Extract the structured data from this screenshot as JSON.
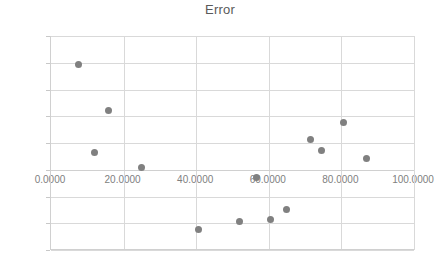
{
  "chart_data": {
    "type": "scatter",
    "title": "Error",
    "xlabel": "",
    "ylabel": "",
    "xlim": [
      0,
      100
    ],
    "ylim": [
      -0.6,
      1.0
    ],
    "grid": true,
    "legend": "none",
    "marker_color": "#808080",
    "x_ticks": [
      "0.0000",
      "20.0000",
      "40.0000",
      "60.0000",
      "80.0000",
      "100.0000"
    ],
    "x_tick_values": [
      0,
      20,
      40,
      60,
      80,
      100
    ],
    "y_ticks": [
      "1.0000",
      "0.8000",
      "0.6000",
      "0.4000",
      "0.2000",
      "0.0000",
      "-0.2000",
      "-0.4000",
      "-0.6000"
    ],
    "y_tick_values": [
      1.0,
      0.8,
      0.6,
      0.4,
      0.2,
      0.0,
      -0.2,
      -0.4,
      -0.6
    ],
    "points": [
      {
        "x": 7.5,
        "y": 0.79
      },
      {
        "x": 12.0,
        "y": 0.13
      },
      {
        "x": 15.8,
        "y": 0.44
      },
      {
        "x": 24.8,
        "y": 0.02
      },
      {
        "x": 40.5,
        "y": -0.45
      },
      {
        "x": 52.0,
        "y": -0.385
      },
      {
        "x": 56.5,
        "y": -0.06
      },
      {
        "x": 60.5,
        "y": -0.375
      },
      {
        "x": 65.0,
        "y": -0.295
      },
      {
        "x": 71.5,
        "y": 0.225
      },
      {
        "x": 74.5,
        "y": 0.145
      },
      {
        "x": 80.5,
        "y": 0.355
      },
      {
        "x": 87.0,
        "y": 0.085
      }
    ]
  }
}
